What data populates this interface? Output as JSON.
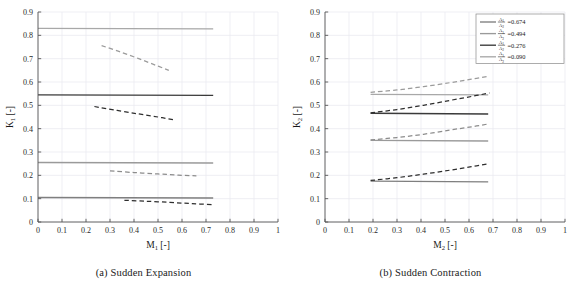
{
  "figure": {
    "panels": [
      {
        "id": "sudden-expansion",
        "caption": "(a) Sudden Expansion",
        "xlabel_base": "M",
        "xlabel_sub": "1",
        "xlabel_unit": "[-]",
        "ylabel_base": "K",
        "ylabel_sub": "1",
        "ylabel_unit": "[-]"
      },
      {
        "id": "sudden-contraction",
        "caption": "(b) Sudden Contraction",
        "xlabel_base": "M",
        "xlabel_sub": "2",
        "xlabel_unit": "[-]",
        "ylabel_base": "K",
        "ylabel_sub": "2",
        "ylabel_unit": "[-]"
      }
    ],
    "legend": {
      "position": "top-right-panel-b",
      "numerator": "A",
      "numerator_sub": "1",
      "denominator": "A",
      "denominator_sub": "2",
      "entries": [
        {
          "label": "=0.674",
          "value": 0.674,
          "color": "#7f7f7f"
        },
        {
          "label": "=0.494",
          "value": 0.494,
          "color": "#9a9a9a"
        },
        {
          "label": "=0.276",
          "value": 0.276,
          "color": "#3a3a3a"
        },
        {
          "label": "=0.090",
          "value": 0.09,
          "color": "#a8a8a8"
        }
      ]
    }
  },
  "chart_data": [
    {
      "type": "line",
      "id": "sudden-expansion",
      "title": "(a) Sudden Expansion",
      "xlabel": "M1 [-]",
      "ylabel": "K1 [-]",
      "xlim": [
        0,
        1
      ],
      "ylim": [
        0,
        0.9
      ],
      "xticks": [
        "0",
        "0.1",
        "0.2",
        "0.3",
        "0.4",
        "0.5",
        "0.6",
        "0.7",
        "0.8",
        "0.9",
        "1"
      ],
      "yticks": [
        "0",
        "0.1",
        "0.2",
        "0.3",
        "0.4",
        "0.5",
        "0.6",
        "0.7",
        "0.8",
        "0.9"
      ],
      "grid": true,
      "legend": "none",
      "series": [
        {
          "name": "A1/A2=0.090 incompressible",
          "style": "solid",
          "color": "#a8a8a8",
          "x": [
            0,
            0.73
          ],
          "y": [
            0.83,
            0.828
          ]
        },
        {
          "name": "A1/A2=0.090 compressible",
          "style": "dashed",
          "color": "#9b9b9b",
          "x": [
            0.265,
            0.34,
            0.42,
            0.49,
            0.545
          ],
          "y": [
            0.756,
            0.73,
            0.7,
            0.672,
            0.65
          ]
        },
        {
          "name": "A1/A2=0.276 incompressible",
          "style": "solid",
          "color": "#3a3a3a",
          "x": [
            0,
            0.73
          ],
          "y": [
            0.545,
            0.543
          ]
        },
        {
          "name": "A1/A2=0.276 compressible",
          "style": "dashed",
          "color": "#2e2e2e",
          "x": [
            0.235,
            0.33,
            0.42,
            0.5,
            0.565
          ],
          "y": [
            0.495,
            0.478,
            0.463,
            0.45,
            0.438
          ]
        },
        {
          "name": "A1/A2=0.494 incompressible",
          "style": "solid",
          "color": "#9a9a9a",
          "x": [
            0,
            0.73
          ],
          "y": [
            0.255,
            0.253
          ]
        },
        {
          "name": "A1/A2=0.494 compressible",
          "style": "dashed",
          "color": "#8c8c8c",
          "x": [
            0.3,
            0.4,
            0.5,
            0.585,
            0.66
          ],
          "y": [
            0.219,
            0.212,
            0.206,
            0.201,
            0.198
          ]
        },
        {
          "name": "A1/A2=0.674 incompressible",
          "style": "solid",
          "color": "#7f7f7f",
          "x": [
            0,
            0.73
          ],
          "y": [
            0.105,
            0.103
          ]
        },
        {
          "name": "A1/A2=0.674 compressible",
          "style": "dashed",
          "color": "#2e2e2e",
          "x": [
            0.36,
            0.45,
            0.55,
            0.64,
            0.73
          ],
          "y": [
            0.093,
            0.089,
            0.084,
            0.079,
            0.074
          ]
        }
      ]
    },
    {
      "type": "line",
      "id": "sudden-contraction",
      "title": "(b) Sudden Contraction",
      "xlabel": "M2 [-]",
      "ylabel": "K2 [-]",
      "xlim": [
        0,
        1
      ],
      "ylim": [
        0,
        0.9
      ],
      "xticks": [
        "0",
        "0.1",
        "0.2",
        "0.3",
        "0.4",
        "0.5",
        "0.6",
        "0.7",
        "0.8",
        "0.9",
        "1"
      ],
      "yticks": [
        "0",
        "0.1",
        "0.2",
        "0.3",
        "0.4",
        "0.5",
        "0.6",
        "0.7",
        "0.8",
        "0.9"
      ],
      "grid": true,
      "legend": "top-right",
      "series": [
        {
          "name": "A1/A2=0.090 incompressible",
          "style": "solid",
          "color": "#a8a8a8",
          "x": [
            0.19,
            0.68
          ],
          "y": [
            0.547,
            0.545
          ]
        },
        {
          "name": "A1/A2=0.090 compressible",
          "style": "dashed",
          "color": "#9b9b9b",
          "x": [
            0.19,
            0.3,
            0.41,
            0.52,
            0.61,
            0.685
          ],
          "y": [
            0.556,
            0.566,
            0.58,
            0.597,
            0.612,
            0.625
          ]
        },
        {
          "name": "A1/A2=0.276 incompressible",
          "style": "solid",
          "color": "#3a3a3a",
          "x": [
            0.19,
            0.68
          ],
          "y": [
            0.466,
            0.463
          ]
        },
        {
          "name": "A1/A2=0.276 compressible",
          "style": "dashed",
          "color": "#2e2e2e",
          "x": [
            0.19,
            0.3,
            0.41,
            0.52,
            0.61,
            0.685
          ],
          "y": [
            0.468,
            0.482,
            0.5,
            0.521,
            0.538,
            0.553
          ]
        },
        {
          "name": "A1/A2=0.494 incompressible",
          "style": "solid",
          "color": "#9a9a9a",
          "x": [
            0.19,
            0.68
          ],
          "y": [
            0.35,
            0.347
          ]
        },
        {
          "name": "A1/A2=0.494 compressible",
          "style": "dashed",
          "color": "#8c8c8c",
          "x": [
            0.19,
            0.3,
            0.41,
            0.52,
            0.61,
            0.685
          ],
          "y": [
            0.352,
            0.362,
            0.376,
            0.394,
            0.408,
            0.421
          ]
        },
        {
          "name": "A1/A2=0.674 incompressible",
          "style": "solid",
          "color": "#7f7f7f",
          "x": [
            0.19,
            0.68
          ],
          "y": [
            0.175,
            0.172
          ]
        },
        {
          "name": "A1/A2=0.674 compressible",
          "style": "dashed",
          "color": "#2e2e2e",
          "x": [
            0.19,
            0.3,
            0.41,
            0.52,
            0.61,
            0.685
          ],
          "y": [
            0.178,
            0.19,
            0.205,
            0.222,
            0.237,
            0.25
          ]
        }
      ]
    }
  ]
}
